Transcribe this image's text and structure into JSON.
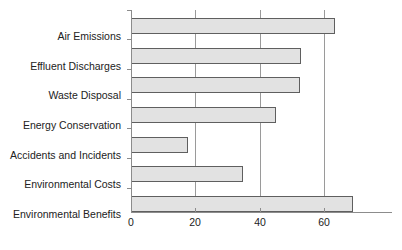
{
  "chart_data": {
    "type": "bar",
    "orientation": "horizontal",
    "title": "",
    "subtitle": "",
    "xlabel": "",
    "ylabel": "",
    "categories": [
      "Air Emissions",
      "Effluent Discharges",
      "Waste Disposal",
      "Energy Conservation",
      "Accidents and Incidents",
      "Environmental Costs",
      "Environmental Benefits"
    ],
    "values": [
      63.5,
      53,
      52.5,
      45,
      17.7,
      35,
      69
    ],
    "xlim": [
      0,
      75
    ],
    "ylim": [
      0,
      7
    ],
    "xticks": [
      0,
      20,
      40,
      60
    ],
    "xtick_labels": [
      "0",
      "20",
      "40",
      "60"
    ],
    "grid": "vertical",
    "legend": "none",
    "series": [
      {
        "name": "",
        "values": [
          63.5,
          53,
          52.5,
          45,
          17.7,
          35,
          69
        ]
      }
    ],
    "colors": {
      "bar_fill": "#e2e2e2",
      "bar_border": "#5f5f5f",
      "gridline": "#9a9a9a",
      "axis": "#8c8c8c",
      "text": "#222222",
      "background": "#ffffff"
    }
  }
}
